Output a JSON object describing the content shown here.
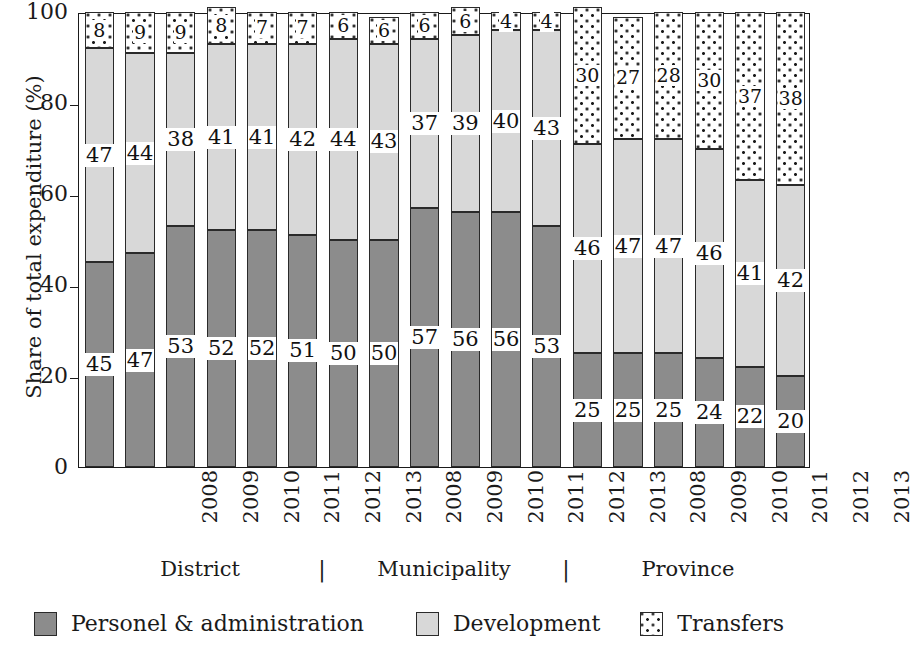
{
  "axes": {
    "y_title": "Share of total expenditure (%)",
    "y_ticks": [
      "100",
      "80",
      "60",
      "40",
      "20",
      "0"
    ],
    "x_title": ""
  },
  "groups": [
    {
      "label": "District",
      "separator_after": "|"
    },
    {
      "label": "Municipality",
      "separator_after": "|"
    },
    {
      "label": "Province",
      "separator_after": ""
    }
  ],
  "legend": [
    {
      "label": "Personel & administration",
      "key": "personnel",
      "color": "#8c8c8c"
    },
    {
      "label": "Development",
      "key": "development",
      "color": "#d8d8d8"
    },
    {
      "label": "Transfers",
      "key": "transfers",
      "color": "#ffffff"
    }
  ],
  "chart_data": {
    "type": "bar",
    "subtype": "stacked-bar",
    "title": "",
    "xlabel": "",
    "ylabel": "Share of total expenditure (%)",
    "ylim": [
      0,
      100
    ],
    "yticks": [
      0,
      20,
      40,
      60,
      80,
      100
    ],
    "grid": false,
    "legend_position": "bottom",
    "group_labels": [
      "District",
      "Municipality",
      "Province"
    ],
    "categories": [
      "2008",
      "2009",
      "2010",
      "2011",
      "2012",
      "2013",
      "2008",
      "2009",
      "2010",
      "2011",
      "2012",
      "2013",
      "2008",
      "2009",
      "2010",
      "2011",
      "2012",
      "2013"
    ],
    "group_of_category": [
      "District",
      "District",
      "District",
      "District",
      "District",
      "District",
      "Municipality",
      "Municipality",
      "Municipality",
      "Municipality",
      "Municipality",
      "Municipality",
      "Province",
      "Province",
      "Province",
      "Province",
      "Province",
      "Province"
    ],
    "series": [
      {
        "name": "Personel & administration",
        "color": "#8c8c8c",
        "values": [
          45,
          47,
          53,
          52,
          52,
          51,
          50,
          50,
          57,
          56,
          56,
          53,
          25,
          25,
          25,
          24,
          22,
          20
        ]
      },
      {
        "name": "Development",
        "color": "#d8d8d8",
        "values": [
          47,
          44,
          38,
          41,
          41,
          42,
          44,
          43,
          37,
          39,
          40,
          43,
          46,
          47,
          47,
          46,
          41,
          42
        ]
      },
      {
        "name": "Transfers",
        "color": "#ffffff",
        "values": [
          8,
          9,
          9,
          8,
          7,
          7,
          6,
          6,
          6,
          6,
          4,
          4,
          30,
          27,
          28,
          30,
          37,
          38
        ]
      }
    ]
  }
}
